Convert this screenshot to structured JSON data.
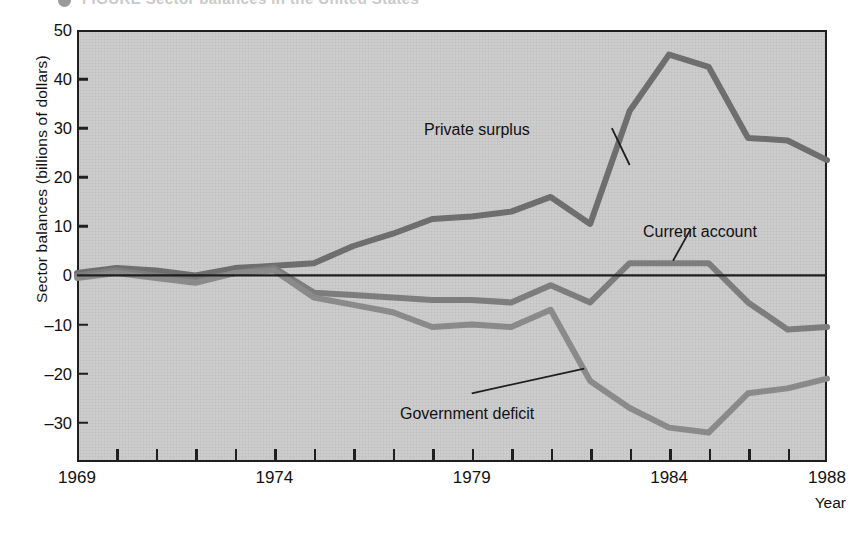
{
  "figure": {
    "top_caption": "FIGURE    Sector balances in the United States",
    "bullet_icon": "bullet-dot-icon"
  },
  "axes": {
    "ylabel": "Sector balances (billions of dollars)",
    "xlabel": "Year",
    "y_ticks": [
      50,
      40,
      30,
      20,
      10,
      0,
      -10,
      -20,
      -30
    ],
    "y_tick_labels": [
      "50",
      "40",
      "30",
      "20",
      "10",
      "0",
      "–10",
      "–20",
      "–30"
    ],
    "ylim": [
      -38,
      50
    ],
    "xlim": [
      1969,
      1988
    ],
    "x_tick_years": [
      1969,
      1970,
      1971,
      1972,
      1973,
      1974,
      1975,
      1976,
      1977,
      1978,
      1979,
      1980,
      1981,
      1982,
      1983,
      1984,
      1985,
      1986,
      1987,
      1988
    ],
    "x_labeled_years": [
      "1969",
      "1974",
      "1979",
      "1984",
      "1988"
    ],
    "zero_line": 0,
    "grid": false
  },
  "style": {
    "plot_background": "#c9c9c9",
    "axis_color": "#1f1f1f",
    "line_color_private": "#6e6e6e",
    "line_color_current": "#7d7d7d",
    "line_color_government": "#8a8a8a",
    "text_color": "#111111"
  },
  "annotations": [
    {
      "name": "private-surplus-label",
      "text": "Private surplus",
      "x": 1980.2,
      "y": 30.5
    },
    {
      "name": "current-account-label",
      "text": "Current account",
      "x": 1984.3,
      "y": 11.5
    },
    {
      "name": "government-deficit-label",
      "text": "Government deficit",
      "x": 1977.9,
      "y": -25.5
    }
  ],
  "chart_data": {
    "type": "line",
    "title": "Sector balances in the United States",
    "xlabel": "Year",
    "ylabel": "Sector balances (billions of dollars)",
    "xlim": [
      1969,
      1988
    ],
    "ylim": [
      -38,
      50
    ],
    "grid": false,
    "legend": "inline-annotations",
    "x": [
      1969,
      1970,
      1971,
      1972,
      1973,
      1974,
      1975,
      1976,
      1977,
      1978,
      1979,
      1980,
      1981,
      1982,
      1983,
      1984,
      1985,
      1986,
      1987,
      1988
    ],
    "series": [
      {
        "name": "Private surplus",
        "color": "#6e6e6e",
        "values": [
          0.5,
          1.5,
          1.0,
          0.0,
          1.5,
          2.0,
          2.5,
          6.0,
          8.5,
          11.5,
          12.0,
          13.0,
          16.0,
          10.5,
          33.5,
          45.0,
          42.5,
          28.0,
          27.5,
          23.5
        ]
      },
      {
        "name": "Current account",
        "color": "#7d7d7d",
        "values": [
          0.0,
          1.0,
          0.0,
          -1.0,
          0.5,
          1.5,
          -3.5,
          -4.0,
          -4.5,
          -5.0,
          -5.0,
          -5.5,
          -2.0,
          -5.5,
          2.5,
          2.5,
          2.5,
          -5.5,
          -11.0,
          -10.5
        ]
      },
      {
        "name": "Government deficit",
        "color": "#8a8a8a",
        "values": [
          -0.5,
          0.5,
          -0.5,
          -1.5,
          0.5,
          1.0,
          -4.5,
          -6.0,
          -7.5,
          -10.5,
          -10.0,
          -10.5,
          -7.0,
          -21.5,
          -27.0,
          -31.0,
          -32.0,
          -24.0,
          -23.0,
          -21.0
        ]
      }
    ]
  }
}
